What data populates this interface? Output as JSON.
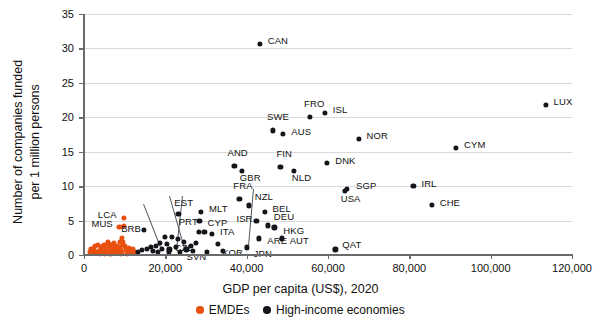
{
  "chart_data": {
    "type": "scatter",
    "title": "",
    "xlabel": "GDP per capita (US$), 2020",
    "ylabel_line1": "Number of companies funded",
    "ylabel_line2": "per 1 million persons",
    "xlim": [
      0,
      120000
    ],
    "ylim": [
      0,
      35
    ],
    "grid": "horizontal",
    "xticks": [
      0,
      20000,
      40000,
      60000,
      80000,
      100000,
      120000
    ],
    "xticklabels": [
      "0",
      "20,000",
      "40,000",
      "60,000",
      "80,000",
      "100,000",
      "120,000"
    ],
    "yticks": [
      0,
      5,
      10,
      15,
      20,
      25,
      30,
      35
    ],
    "yticklabels": [
      "0",
      "5",
      "10",
      "15",
      "20",
      "25",
      "30",
      "35"
    ],
    "legend_position": "bottom-center",
    "series": [
      {
        "name": "EMDEs",
        "color": "#e8500f",
        "points": [
          {
            "label": "LCA",
            "x": 9800,
            "y": 5.4,
            "lx": -26,
            "ly": -4
          },
          {
            "label": "MUS",
            "x": 8700,
            "y": 4.1,
            "lx": -28,
            "ly": -4
          },
          {
            "label": "",
            "x": 9900,
            "y": 4.2
          },
          {
            "label": "",
            "x": 9400,
            "y": 2.5
          },
          {
            "label": "",
            "x": 9600,
            "y": 1.9
          },
          {
            "label": "",
            "x": 9500,
            "y": 1.5
          },
          {
            "label": "",
            "x": 2400,
            "y": 0.9
          },
          {
            "label": "",
            "x": 2800,
            "y": 0.5
          },
          {
            "label": "",
            "x": 3100,
            "y": 0.35
          },
          {
            "label": "",
            "x": 3400,
            "y": 1.5
          },
          {
            "label": "",
            "x": 3600,
            "y": 0.6
          },
          {
            "label": "",
            "x": 3900,
            "y": 0.4
          },
          {
            "label": "",
            "x": 4200,
            "y": 1.1
          },
          {
            "label": "",
            "x": 4500,
            "y": 0.7
          },
          {
            "label": "",
            "x": 4700,
            "y": 0.3
          },
          {
            "label": "",
            "x": 5000,
            "y": 1.4
          },
          {
            "label": "",
            "x": 5300,
            "y": 0.9
          },
          {
            "label": "",
            "x": 5500,
            "y": 0.5
          },
          {
            "label": "",
            "x": 5800,
            "y": 0.3
          },
          {
            "label": "",
            "x": 6100,
            "y": 1.6
          },
          {
            "label": "",
            "x": 6300,
            "y": 1.2
          },
          {
            "label": "",
            "x": 6600,
            "y": 0.8
          },
          {
            "label": "",
            "x": 6800,
            "y": 0.45
          },
          {
            "label": "",
            "x": 7000,
            "y": 1.5
          },
          {
            "label": "",
            "x": 7200,
            "y": 1.0
          },
          {
            "label": "",
            "x": 7500,
            "y": 0.6
          },
          {
            "label": "",
            "x": 7700,
            "y": 0.3
          },
          {
            "label": "",
            "x": 8000,
            "y": 1.3
          },
          {
            "label": "",
            "x": 8200,
            "y": 0.9
          },
          {
            "label": "",
            "x": 8400,
            "y": 0.5
          },
          {
            "label": "",
            "x": 8700,
            "y": 1.1
          },
          {
            "label": "",
            "x": 9000,
            "y": 0.7
          },
          {
            "label": "",
            "x": 9200,
            "y": 0.35
          },
          {
            "label": "",
            "x": 10100,
            "y": 1.3
          },
          {
            "label": "",
            "x": 10400,
            "y": 0.8
          },
          {
            "label": "",
            "x": 10700,
            "y": 0.45
          },
          {
            "label": "",
            "x": 11000,
            "y": 1.0
          },
          {
            "label": "",
            "x": 11300,
            "y": 0.6
          },
          {
            "label": "",
            "x": 11600,
            "y": 0.3
          },
          {
            "label": "",
            "x": 1500,
            "y": 0.5
          },
          {
            "label": "",
            "x": 1800,
            "y": 0.8
          },
          {
            "label": "",
            "x": 2100,
            "y": 0.35
          },
          {
            "label": "",
            "x": 12000,
            "y": 0.8
          },
          {
            "label": "",
            "x": 12400,
            "y": 0.45
          },
          {
            "label": "",
            "x": 4000,
            "y": 0.2
          },
          {
            "label": "",
            "x": 5200,
            "y": 0.2
          },
          {
            "label": "",
            "x": 6500,
            "y": 0.2
          },
          {
            "label": "",
            "x": 7800,
            "y": 0.25
          },
          {
            "label": "",
            "x": 9100,
            "y": 0.2
          },
          {
            "label": "",
            "x": 10500,
            "y": 0.2
          },
          {
            "label": "",
            "x": 2600,
            "y": 1.3
          },
          {
            "label": "",
            "x": 5900,
            "y": 1.9
          },
          {
            "label": "",
            "x": 7400,
            "y": 1.7
          },
          {
            "label": "",
            "x": 8900,
            "y": 1.9
          }
        ]
      },
      {
        "name": "High-income economies",
        "color": "#14161c",
        "points": [
          {
            "label": "CAN",
            "x": 43200,
            "y": 30.7,
            "lx": 8,
            "ly": -4
          },
          {
            "label": "LUX",
            "x": 113500,
            "y": 21.8,
            "lx": 8,
            "ly": -4
          },
          {
            "label": "ISL",
            "x": 59200,
            "y": 20.6,
            "lx": 8,
            "ly": -4
          },
          {
            "label": "FRO",
            "x": 55600,
            "y": 20.0,
            "lx": -6,
            "ly": -14
          },
          {
            "label": "SWE",
            "x": 46500,
            "y": 18.1,
            "lx": -6,
            "ly": -14
          },
          {
            "label": "AUS",
            "x": 49000,
            "y": 17.6,
            "lx": 8,
            "ly": -3
          },
          {
            "label": "NOR",
            "x": 67500,
            "y": 16.9,
            "lx": 8,
            "ly": -4
          },
          {
            "label": "CYM",
            "x": 91500,
            "y": 15.6,
            "lx": 8,
            "ly": -4
          },
          {
            "label": "AND",
            "x": 37000,
            "y": 12.9,
            "lx": -7,
            "ly": -14
          },
          {
            "label": "GBR",
            "x": 38800,
            "y": 12.2,
            "lx": -2,
            "ly": 6
          },
          {
            "label": "FIN",
            "x": 48300,
            "y": 12.8,
            "lx": -4,
            "ly": -14
          },
          {
            "label": "NLD",
            "x": 51600,
            "y": 12.2,
            "lx": -2,
            "ly": 6
          },
          {
            "label": "DNK",
            "x": 59800,
            "y": 13.4,
            "lx": 8,
            "ly": -3
          },
          {
            "label": "SGP",
            "x": 64700,
            "y": 9.6,
            "lx": 9,
            "ly": -4
          },
          {
            "label": "USA",
            "x": 64100,
            "y": 9.3,
            "lx": -4,
            "ly": 7
          },
          {
            "label": "IRL",
            "x": 81000,
            "y": 10.0,
            "lx": 8,
            "ly": -3
          },
          {
            "label": "CHE",
            "x": 85500,
            "y": 7.3,
            "lx": 8,
            "ly": -3
          },
          {
            "label": "FRA",
            "x": 38200,
            "y": 8.1,
            "lx": -6,
            "ly": -14
          },
          {
            "label": "NZL",
            "x": 40500,
            "y": 7.2,
            "lx": 6,
            "ly": -9
          },
          {
            "label": "BEL",
            "x": 44400,
            "y": 6.3,
            "lx": 8,
            "ly": -4
          },
          {
            "label": "MLT",
            "x": 28800,
            "y": 6.2,
            "lx": 8,
            "ly": -4
          },
          {
            "label": "EST",
            "x": 23200,
            "y": 6.0,
            "lx": -4,
            "ly": -12
          },
          {
            "label": "CYP",
            "x": 28400,
            "y": 4.9,
            "lx": 8,
            "ly": 1
          },
          {
            "label": "ISR",
            "x": 42400,
            "y": 4.9,
            "lx": -20,
            "ly": -3
          },
          {
            "label": "DEU",
            "x": 45200,
            "y": 4.3,
            "lx": 6,
            "ly": -9
          },
          {
            "label": "HKG",
            "x": 46800,
            "y": 4.0,
            "lx": 9,
            "ly": 3
          },
          {
            "label": "BRB",
            "x": 14800,
            "y": 3.6,
            "lx": -23,
            "ly": -2
          },
          {
            "label": "PRT",
            "x": 28200,
            "y": 3.4,
            "lx": -20,
            "ly": -11
          },
          {
            "label": "ITA",
            "x": 31500,
            "y": 3.1,
            "lx": 8,
            "ly": -3
          },
          {
            "label": "ARE",
            "x": 43100,
            "y": 2.4,
            "lx": 8,
            "ly": 2
          },
          {
            "label": "AUT",
            "x": 48600,
            "y": 2.4,
            "lx": 8,
            "ly": 2
          },
          {
            "label": "CZE",
            "x": 23000,
            "y": 2.3,
            "lx": -3,
            "ly": 8
          },
          {
            "label": "KOR",
            "x": 33000,
            "y": 1.6,
            "lx": 4,
            "ly": 8
          },
          {
            "label": "JPN",
            "x": 40000,
            "y": 1.1,
            "lx": 7,
            "ly": 6
          },
          {
            "label": "SVN",
            "x": 25200,
            "y": 0.8,
            "lx": 0,
            "ly": 7
          },
          {
            "label": "QAT",
            "x": 61800,
            "y": 0.8,
            "lx": 7,
            "ly": -5
          },
          {
            "label": "",
            "x": 21600,
            "y": 2.6
          },
          {
            "label": "",
            "x": 19900,
            "y": 2.6
          },
          {
            "label": "",
            "x": 18600,
            "y": 1.8
          },
          {
            "label": "",
            "x": 20300,
            "y": 1.6
          },
          {
            "label": "",
            "x": 17600,
            "y": 1.3
          },
          {
            "label": "",
            "x": 16400,
            "y": 1.2
          },
          {
            "label": "",
            "x": 19100,
            "y": 0.9
          },
          {
            "label": "",
            "x": 21000,
            "y": 0.8
          },
          {
            "label": "",
            "x": 22500,
            "y": 1.2
          },
          {
            "label": "",
            "x": 15400,
            "y": 0.9
          },
          {
            "label": "",
            "x": 14300,
            "y": 0.7
          },
          {
            "label": "",
            "x": 13300,
            "y": 0.5
          },
          {
            "label": "",
            "x": 16900,
            "y": 0.6
          },
          {
            "label": "",
            "x": 18200,
            "y": 0.45
          },
          {
            "label": "",
            "x": 20800,
            "y": 0.4
          },
          {
            "label": "",
            "x": 23600,
            "y": 0.5
          },
          {
            "label": "",
            "x": 26200,
            "y": 1.3
          },
          {
            "label": "",
            "x": 27600,
            "y": 1.7
          },
          {
            "label": "",
            "x": 24600,
            "y": 1.9
          },
          {
            "label": "",
            "x": 29600,
            "y": 3.4
          },
          {
            "label": "",
            "x": 26800,
            "y": 0.6
          },
          {
            "label": "",
            "x": 30200,
            "y": 0.5
          },
          {
            "label": "",
            "x": 34200,
            "y": 0.6
          }
        ]
      }
    ],
    "leaders": [
      {
        "x1": 144,
        "y1": 204,
        "x2": 161,
        "y2": 247
      },
      {
        "x1": 170,
        "y1": 196,
        "x2": 186,
        "y2": 252
      },
      {
        "x1": 183,
        "y1": 196,
        "x2": 177,
        "y2": 250
      },
      {
        "x1": 254,
        "y1": 189,
        "x2": 249,
        "y2": 246
      }
    ]
  },
  "legend": {
    "items": [
      {
        "label": "EMDEs",
        "color": "#e8500f"
      },
      {
        "label": "High-income economies",
        "color": "#14161c"
      }
    ]
  }
}
